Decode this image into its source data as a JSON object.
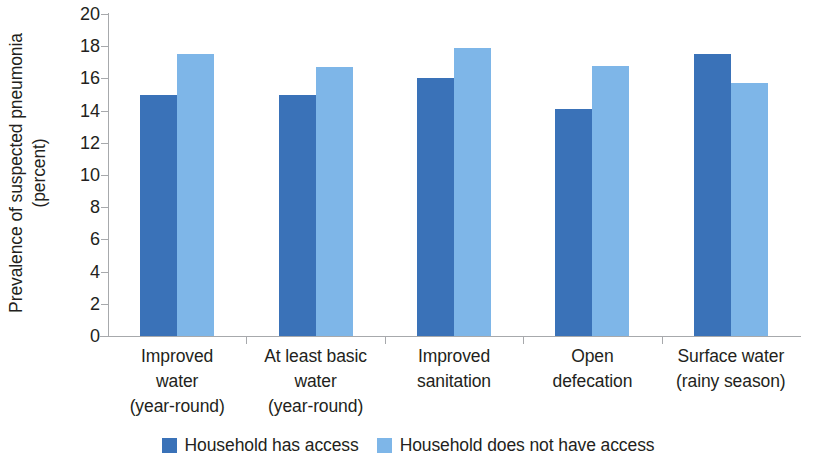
{
  "chart_data": {
    "type": "bar",
    "title": "",
    "subtitle": "",
    "xlabel": "",
    "ylabel": "Prevalence of suspected pneumonia (percent)",
    "ylabel_line1": "Prevalence of suspected pneumonia",
    "ylabel_line2": "(percent)",
    "ylim": [
      0,
      20
    ],
    "ytick_step": 2,
    "ytick_labels": [
      "20",
      "18",
      "16",
      "14",
      "12",
      "10",
      "8",
      "6",
      "4",
      "2",
      "0"
    ],
    "ytick_values": [
      20,
      18,
      16,
      14,
      12,
      10,
      8,
      6,
      4,
      2,
      0
    ],
    "grid": false,
    "legend_position": "bottom-center",
    "categories": [
      "Improved water (year-round)",
      "At least basic water (year-round)",
      "Improved sanitation",
      "Open defecation",
      "Surface water (rainy season)"
    ],
    "category_label_lines": [
      [
        "Improved",
        "water",
        "(year-round)"
      ],
      [
        "At least basic",
        "water",
        "(year-round)"
      ],
      [
        "Improved",
        "sanitation"
      ],
      [
        "Open",
        "defecation"
      ],
      [
        "Surface water",
        "(rainy season)"
      ]
    ],
    "series": [
      {
        "name": "Household has access",
        "color": "#3a72b8",
        "values": [
          15.0,
          15.0,
          16.0,
          14.1,
          17.5
        ]
      },
      {
        "name": "Household does not have access",
        "color": "#7eb6e8",
        "values": [
          17.5,
          16.7,
          17.9,
          16.8,
          15.7
        ]
      }
    ]
  },
  "legend": {
    "items": [
      {
        "label": "Household has access",
        "color": "#3a72b8"
      },
      {
        "label": "Household does not have access",
        "color": "#7eb6e8"
      }
    ]
  },
  "colors": {
    "series_dark": "#3a72b8",
    "series_light": "#7eb6e8",
    "axis": "#a7a9ac",
    "text": "#231f20",
    "background": "#ffffff"
  }
}
